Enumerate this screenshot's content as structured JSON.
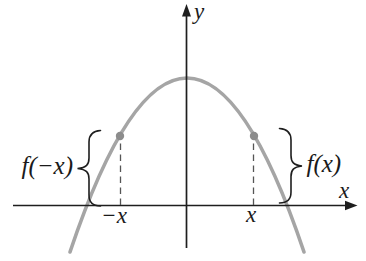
{
  "labels": {
    "y_axis": "y",
    "x_axis": "x",
    "left_brace_value": "f(−x)",
    "right_brace_value": "f(x)",
    "left_x_tick": "−x",
    "right_x_tick": "x"
  },
  "colors": {
    "background": "#ffffff",
    "axis": "#1e1e1e",
    "curve": "#a5a5a5",
    "marker": "#8c8c8c",
    "dashed_line": "#555555",
    "text": "#1a1a1a"
  }
}
